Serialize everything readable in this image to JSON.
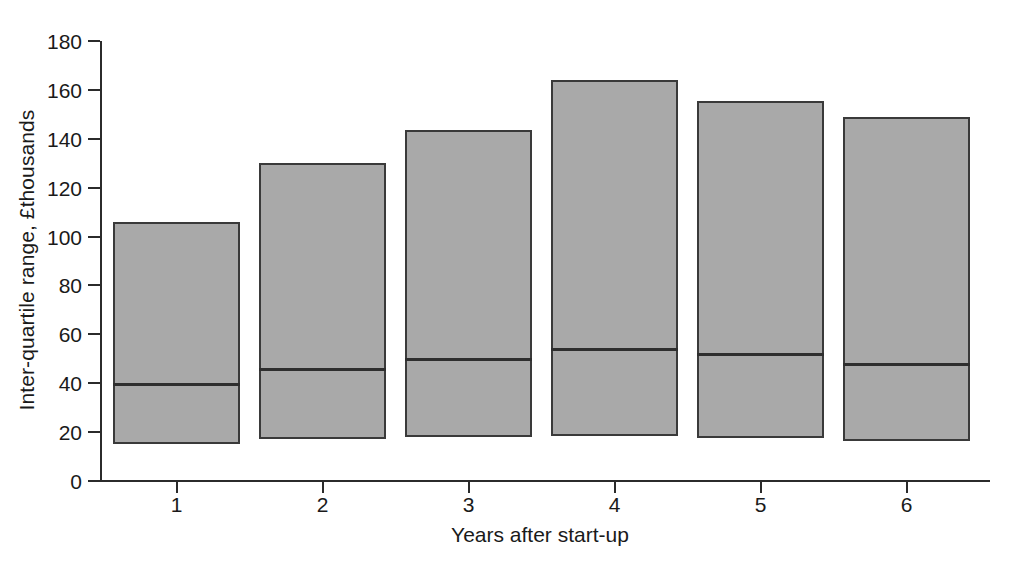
{
  "chart_data": {
    "type": "bar",
    "title": "",
    "subtitle": "",
    "xlabel": "Years after start-up",
    "ylabel": "Inter-quartile range, £thousands",
    "categories": [
      "1",
      "2",
      "3",
      "4",
      "5",
      "6"
    ],
    "ylim": [
      0,
      180
    ],
    "yticks": [
      0,
      20,
      40,
      60,
      80,
      100,
      120,
      140,
      160,
      180
    ],
    "ytick_labels": [
      "0",
      "20",
      "40",
      "60",
      "80",
      "100",
      "120",
      "140",
      "160",
      "180"
    ],
    "grid": false,
    "legend": null,
    "series": [
      {
        "name": "Lower quartile",
        "values": [
          15,
          17,
          18,
          18.5,
          17.5,
          16.5
        ]
      },
      {
        "name": "Median",
        "values": [
          39.5,
          46,
          50,
          54,
          52,
          48
        ]
      },
      {
        "name": "Upper quartile",
        "values": [
          106,
          130,
          143.5,
          164,
          155.5,
          149
        ]
      }
    ],
    "bars": [
      {
        "category": "1",
        "lower": 15,
        "median": 39.5,
        "upper": 106
      },
      {
        "category": "2",
        "lower": 17,
        "median": 46,
        "upper": 130
      },
      {
        "category": "3",
        "lower": 18,
        "median": 50,
        "upper": 143.5
      },
      {
        "category": "4",
        "lower": 18.5,
        "median": 54,
        "upper": 164
      },
      {
        "category": "5",
        "lower": 17.5,
        "median": 52,
        "upper": 155.5
      },
      {
        "category": "6",
        "lower": 16.5,
        "median": 48,
        "upper": 149
      }
    ],
    "colors": {
      "bar_fill": "#a9a9a9",
      "bar_edge": "#3a3a3a",
      "median": "#2e2e2e",
      "axis": "#2b2b2b",
      "text": "#1a1a1a",
      "background": "#ffffff"
    }
  }
}
